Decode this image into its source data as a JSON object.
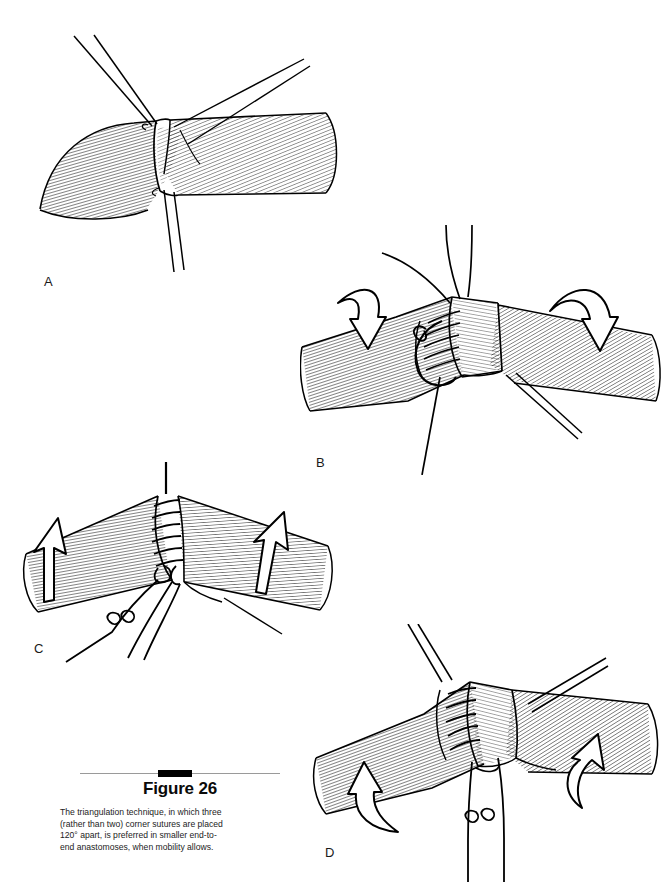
{
  "page": {
    "background_color": "#ffffff",
    "ink_color": "#000000",
    "width": 672,
    "height": 887,
    "top_cropped_fragment": ""
  },
  "figure": {
    "title": "Figure 26",
    "rule": {
      "color": "#9a9a9a",
      "block_color": "#000000"
    },
    "caption_lines": [
      "The triangulation technique, in which three",
      "(rather than two) corner sutures are placed",
      "120° apart, is preferred in smaller end-to-",
      "end anastomoses, when mobility allows."
    ],
    "caption_full": "The triangulation technique, in which three (rather than two) corner sutures are placed 120° apart, is preferred in smaller end-to-end anastomoses, when mobility allows."
  },
  "panels": [
    {
      "id": "A",
      "label": "A",
      "label_x": 44,
      "label_y": 274,
      "description": "Two divided tubular vessel ends approximated; three corner stay sutures placed 120 degrees apart emerge as paired thread tails at upper-left, upper-right and bottom.",
      "suture_tails": 3,
      "arrows": []
    },
    {
      "id": "B",
      "label": "B",
      "label_x": 316,
      "label_y": 455,
      "description": "First segment sutured with a running stitch between two corner sutures; curved hollow arrows on each side indicate rotation of the vessel toward the viewer.",
      "suture_tails": 3,
      "arrows": [
        "rotate-down-left",
        "rotate-down-right"
      ]
    },
    {
      "id": "C",
      "label": "C",
      "label_x": 34,
      "label_y": 641,
      "description": "Second face of the anastomosis completed with a running suture; straight hollow arrows on each side indicate lifting and rotating the vessel.",
      "suture_tails": 2,
      "arrows": [
        "lift-up-left",
        "lift-up-right"
      ]
    },
    {
      "id": "D",
      "label": "D",
      "label_x": 325,
      "label_y": 845,
      "description": "Final face being sutured after further rotation; curved hollow arrows on each side indicate continued rotation, with knotted suture tails hanging below.",
      "suture_tails": 3,
      "arrows": [
        "rotate-up-left",
        "rotate-up-right"
      ]
    }
  ]
}
